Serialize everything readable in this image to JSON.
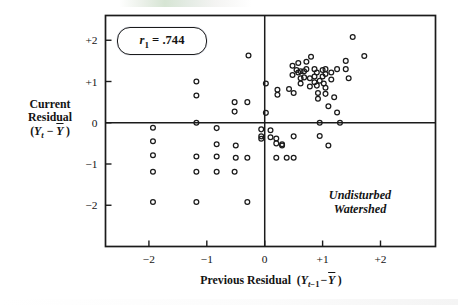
{
  "figure": {
    "name": "autocorrelation-lag-plot",
    "annotation_lines": [
      "Undisturbed",
      "Watershed"
    ],
    "correlation_label": "r₁ = .744"
  },
  "chart_data": {
    "type": "scatter",
    "title": "",
    "subtitle": "",
    "xlabel": "Previous Residual  (Yₜ₋₁ − Ȳ)",
    "xlabel_parts": {
      "text": "Previous Residual",
      "paren_open": "(",
      "var": "Y",
      "sub": "t−1",
      "minus": "−",
      "mean": "Y",
      "paren_close": ")"
    },
    "ylabel": "Current Residual (Yₜ − Ȳ)",
    "ylabel_lines": [
      "Current",
      "Residual",
      "(Yₜ − Ȳ)"
    ],
    "ylabel_parts": {
      "line1": "Current",
      "line2": "Residual",
      "paren_open": "(",
      "var": "Y",
      "sub": "t",
      "minus": "−",
      "mean": "Y",
      "paren_close": ")"
    },
    "xlim": [
      -2.75,
      2.95
    ],
    "ylim": [
      -3.0,
      2.6
    ],
    "xticks": [
      -2,
      -1,
      0,
      1,
      2
    ],
    "xticklabels": [
      "−2",
      "−1",
      "0",
      "+1",
      "+2"
    ],
    "yticks": [
      -2,
      -1,
      0,
      1,
      2
    ],
    "yticklabels": [
      "−2",
      "−1",
      "0",
      "+1",
      "+2"
    ],
    "grid": false,
    "legend": "none",
    "reference_lines": [
      {
        "axis": "horizontal",
        "value": 0
      },
      {
        "axis": "vertical",
        "value": 0
      }
    ],
    "marker": {
      "shape": "circle",
      "fill": "none",
      "edge_color": "#1b1b1b",
      "size_px": 4.6
    },
    "annotations": [
      {
        "text": "r₁ = .744",
        "x": -2.0,
        "y": 2.15,
        "style": "rounded-box"
      },
      {
        "text": "Undisturbed Watershed",
        "x": 1.55,
        "y": -1.6,
        "style": "italic"
      }
    ],
    "n_points": 88,
    "points": [
      [
        -1.93,
        -0.12
      ],
      [
        -1.93,
        -0.45
      ],
      [
        -1.93,
        -0.79
      ],
      [
        -1.93,
        -1.19
      ],
      [
        -1.93,
        -1.92
      ],
      [
        -1.18,
        1.0
      ],
      [
        -1.18,
        0.66
      ],
      [
        -1.18,
        0.0
      ],
      [
        -1.18,
        -0.82
      ],
      [
        -1.18,
        -1.19
      ],
      [
        -1.18,
        -1.92
      ],
      [
        -0.83,
        -0.13
      ],
      [
        -0.83,
        -0.52
      ],
      [
        -0.83,
        -0.82
      ],
      [
        -0.83,
        -1.19
      ],
      [
        -0.52,
        0.5
      ],
      [
        -0.52,
        0.27
      ],
      [
        -0.52,
        -1.19
      ],
      [
        -0.5,
        -0.55
      ],
      [
        -0.5,
        -0.85
      ],
      [
        -0.3,
        0.5
      ],
      [
        -0.3,
        -0.85
      ],
      [
        -0.3,
        -1.92
      ],
      [
        -0.28,
        1.63
      ],
      [
        -0.06,
        -0.16
      ],
      [
        -0.06,
        -0.33
      ],
      [
        -0.06,
        -0.39
      ],
      [
        0.02,
        0.95
      ],
      [
        0.02,
        0.24
      ],
      [
        0.1,
        -0.18
      ],
      [
        0.1,
        -0.35
      ],
      [
        0.22,
        0.8
      ],
      [
        0.22,
        0.68
      ],
      [
        0.2,
        -0.38
      ],
      [
        0.2,
        -0.5
      ],
      [
        0.2,
        -0.85
      ],
      [
        0.38,
        -0.85
      ],
      [
        0.48,
        1.38
      ],
      [
        0.48,
        1.16
      ],
      [
        0.5,
        0.72
      ],
      [
        0.5,
        -0.33
      ],
      [
        0.5,
        -0.85
      ],
      [
        0.58,
        1.45
      ],
      [
        0.58,
        1.22
      ],
      [
        0.62,
        1.25
      ],
      [
        0.62,
        1.08
      ],
      [
        0.62,
        0.95
      ],
      [
        0.68,
        1.25
      ],
      [
        0.68,
        1.1
      ],
      [
        0.72,
        1.48
      ],
      [
        0.72,
        1.3
      ],
      [
        0.78,
        1.08
      ],
      [
        0.78,
        0.88
      ],
      [
        0.8,
        1.6
      ],
      [
        0.86,
        1.3
      ],
      [
        0.86,
        1.12
      ],
      [
        0.86,
        0.98
      ],
      [
        0.9,
        1.22
      ],
      [
        0.9,
        0.9
      ],
      [
        0.92,
        0.72
      ],
      [
        0.92,
        0.58
      ],
      [
        0.95,
        0.0
      ],
      [
        0.95,
        -0.32
      ],
      [
        1.0,
        1.28
      ],
      [
        1.0,
        1.12
      ],
      [
        1.05,
        1.3
      ],
      [
        1.05,
        1.18
      ],
      [
        1.05,
        0.85
      ],
      [
        1.05,
        0.7
      ],
      [
        1.1,
        0.4
      ],
      [
        1.1,
        -0.55
      ],
      [
        1.15,
        1.22
      ],
      [
        1.15,
        1.05
      ],
      [
        1.2,
        0.62
      ],
      [
        1.25,
        1.3
      ],
      [
        1.25,
        0.25
      ],
      [
        1.3,
        0.0
      ],
      [
        1.4,
        1.5
      ],
      [
        1.4,
        1.3
      ],
      [
        1.45,
        1.08
      ],
      [
        1.52,
        2.08
      ],
      [
        1.72,
        1.62
      ],
      [
        0.3,
        -0.52
      ],
      [
        0.3,
        -0.55
      ],
      [
        0.55,
        1.28
      ],
      [
        0.95,
        1.02
      ],
      [
        1.02,
        0.95
      ],
      [
        0.42,
        0.82
      ]
    ]
  }
}
